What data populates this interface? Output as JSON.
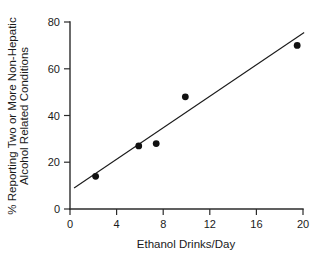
{
  "chart_data": {
    "type": "scatter",
    "title": "",
    "xlabel": "Ethanol Drinks/Day",
    "ylabel": "% Reporting Two or More Non-Hepatic Alcohol Related Conditions",
    "ylabel_line1": "% Reporting Two or More Non-Hepatic",
    "ylabel_line2": "Alcohol Related Conditions",
    "xlim": [
      0,
      20
    ],
    "ylim": [
      0,
      80
    ],
    "xticks": [
      0,
      4,
      8,
      12,
      16,
      20
    ],
    "yticks": [
      0,
      20,
      40,
      60,
      80
    ],
    "xtick_labels": [
      "0",
      "4",
      "8",
      "12",
      "16",
      "20"
    ],
    "ytick_labels": [
      "0",
      "20",
      "40",
      "60",
      "80"
    ],
    "grid": false,
    "legend": false,
    "marker": "filled-circle",
    "marker_color": "#111111",
    "points": [
      {
        "x": 2.2,
        "y": 14
      },
      {
        "x": 5.9,
        "y": 27
      },
      {
        "x": 7.4,
        "y": 28
      },
      {
        "x": 9.9,
        "y": 48
      },
      {
        "x": 19.5,
        "y": 70
      }
    ],
    "x": [
      2.2,
      5.9,
      7.4,
      9.9,
      19.5
    ],
    "values": [
      14,
      27,
      28,
      48,
      70
    ],
    "trend_line": {
      "type": "linear-fit",
      "color": "#1a1a1a",
      "x_start": 0.35,
      "y_start": 9,
      "x_end": 20.1,
      "y_end": 75.5
    },
    "annotations": []
  }
}
